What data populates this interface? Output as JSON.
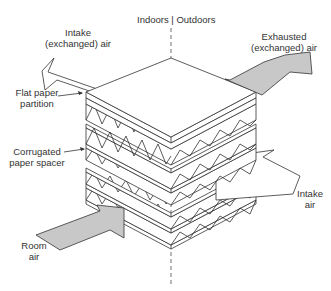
{
  "diagram": {
    "divider": {
      "left_label": "Indoors",
      "right_label": "Outdoors",
      "separator": "|"
    },
    "labels": {
      "intake_exchanged_line1": "Intake",
      "intake_exchanged_line2": "(exchanged) air",
      "exhausted_line1": "Exhausted",
      "exhausted_line2": "(exchanged) air",
      "flat_paper_line1": "Flat paper",
      "flat_paper_line2": "partition",
      "corrugated_line1": "Corrugated",
      "corrugated_line2": "paper spacer",
      "intake_air_line1": "Intake",
      "intake_air_line2": "air",
      "room_air_line1": "Room",
      "room_air_line2": "air"
    },
    "colors": {
      "line": "#333333",
      "gray_arrow": "#c8c8c8",
      "white_arrow": "#ffffff",
      "background": "#ffffff"
    }
  }
}
